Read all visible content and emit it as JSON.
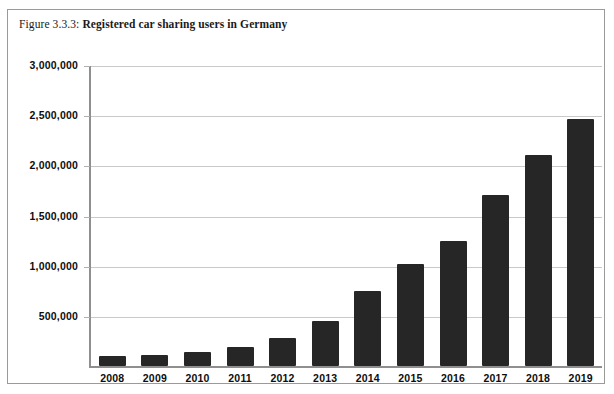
{
  "figure": {
    "caption_number": "Figure 3.3.3:",
    "caption_title": "Registered car sharing users in Germany"
  },
  "style": {
    "bar_color": "#262626",
    "gridline_color": "#c9c9c9",
    "axis_color": "#8f8f8f",
    "frame_color": "#9a9a9a",
    "background": "#ffffff",
    "text_color": "#0d0d0d"
  },
  "chart_data": {
    "type": "bar",
    "title": "Registered car sharing users in Germany",
    "subtitle": "",
    "xlabel": "",
    "ylabel": "",
    "categories": [
      "2008",
      "2009",
      "2010",
      "2011",
      "2012",
      "2013",
      "2014",
      "2015",
      "2016",
      "2017",
      "2018",
      "2019"
    ],
    "values": [
      100000,
      110000,
      140000,
      190000,
      280000,
      450000,
      750000,
      1020000,
      1250000,
      1700000,
      2100000,
      2460000
    ],
    "ylim": [
      0,
      3000000
    ],
    "ytick_labels": [
      "3,000,000",
      "2,500,000",
      "2,000,000",
      "1,500,000",
      "1,000,000",
      "500,000"
    ],
    "ytick_values": [
      3000000,
      2500000,
      2000000,
      1500000,
      1000000,
      500000
    ],
    "grid": true,
    "legend": false,
    "legend_position": "none",
    "series": [
      {
        "name": "Registered car sharing users",
        "values": [
          100000,
          110000,
          140000,
          190000,
          280000,
          450000,
          750000,
          1020000,
          1250000,
          1700000,
          2100000,
          2460000
        ]
      }
    ]
  }
}
